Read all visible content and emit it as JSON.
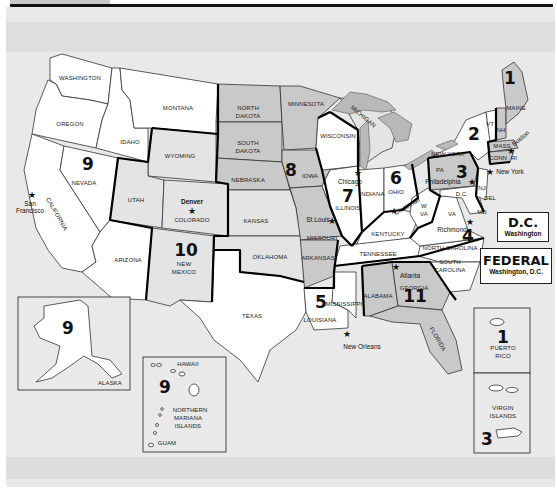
{
  "map": {
    "title": "Federal Regions of the United States",
    "colors": {
      "background": "#e9e9e9",
      "state_white": "#ffffff",
      "state_grey": "#c9c9c9",
      "state_light_grey": "#e4e4e4",
      "region_border": "#000000"
    },
    "regions": [
      {
        "number": "1",
        "states": [
          "MAINE",
          "NH",
          "VT",
          "MASS",
          "CONN",
          "RI"
        ],
        "hq_city": "Boston"
      },
      {
        "number": "2",
        "states": [
          "NEW YORK",
          "NJ",
          "PUERTO RICO",
          "VIRGIN ISLANDS"
        ],
        "hq_city": "New York"
      },
      {
        "number": "3",
        "states": [
          "PA",
          "DEL",
          "MD",
          "VA",
          "W VA",
          "D.C."
        ],
        "hq_city": "Philadelphia"
      },
      {
        "number": "4",
        "states": [
          "KENTUCKY",
          "TENNESSEE",
          "NORTH CAROLINA",
          "SOUTH CAROLINA"
        ],
        "hq_city": "Richmond"
      },
      {
        "number": "5",
        "states": [
          "LOUISIANA",
          "MISSISSIPPI"
        ],
        "hq_city": "New Orleans"
      },
      {
        "number": "6",
        "states": [
          "OHIO",
          "INDIANA",
          "MICHIGAN"
        ],
        "hq_city": "Cincinnati"
      },
      {
        "number": "7",
        "states": [
          "ILLINOIS",
          "WISCONSIN"
        ],
        "hq_city": "Chicago"
      },
      {
        "number": "8",
        "states": [
          "NORTH DAKOTA",
          "SOUTH DAKOTA",
          "NEBRASKA",
          "MINNESOTA",
          "IOWA",
          "MISSOURI",
          "ARKANSAS",
          "KANSAS",
          "OKLAHOMA"
        ],
        "hq_city": "St.Louis"
      },
      {
        "number": "9",
        "states": [
          "WASHINGTON",
          "OREGON",
          "IDAHO",
          "MONTANA",
          "CALIFORNIA",
          "NEVADA",
          "ARIZONA",
          "ALASKA",
          "HAWAII",
          "NORTHERN MARIANA ISLANDS",
          "GUAM"
        ],
        "hq_city": "San Francisco"
      },
      {
        "number": "10",
        "states": [
          "WYOMING",
          "UTAH",
          "COLORADO",
          "NEW MEXICO"
        ],
        "hq_city": "Denver"
      },
      {
        "number": "11",
        "states": [
          "ALABAMA",
          "GEORGIA",
          "FLORIDA"
        ],
        "hq_city": "Atlanta"
      }
    ],
    "state_labels": {
      "washington": "WASHINGTON",
      "oregon": "OREGON",
      "idaho": "IDAHO",
      "montana": "MONTANA",
      "wyoming": "WYOMING",
      "nevada": "NEVADA",
      "california": "CALIFORNIA",
      "utah": "UTAH",
      "colorado": "COLORADO",
      "arizona": "ARIZONA",
      "new_mexico_1": "NEW",
      "new_mexico_2": "MEXICO",
      "north_dakota_1": "NORTH",
      "north_dakota_2": "DAKOTA",
      "south_dakota_1": "SOUTH",
      "south_dakota_2": "DAKOTA",
      "nebraska": "NEBRASKA",
      "kansas": "KANSAS",
      "oklahoma": "OKLAHOMA",
      "texas": "TEXAS",
      "minnesota": "MINNESOTA",
      "iowa": "IOWA",
      "missouri": "MISSOURI",
      "arkansas": "ARKANSAS",
      "louisiana": "LOUISIANA",
      "mississippi": "MISSISSIPPI",
      "wisconsin": "WISCONSIN",
      "illinois": "ILLINOIS",
      "michigan": "MICHIGAN",
      "indiana": "INDIANA",
      "ohio": "OHIO",
      "kentucky": "KENTUCKY",
      "tennessee": "TENNESSEE",
      "alabama": "ALABAMA",
      "georgia": "GEORGIA",
      "florida": "FLORIDA",
      "south_carolina_1": "SOUTH",
      "south_carolina_2": "CAROLINA",
      "north_carolina": "NORTH CAROLINA",
      "virginia": "VA",
      "west_virginia_1": "W",
      "west_virginia_2": "VA",
      "pennsylvania": "PA",
      "new_york": "NEW YORK",
      "vermont": "VT",
      "new_hampshire": "NH",
      "maine": "MAINE",
      "massachusetts": "MASS",
      "connecticut": "CONN",
      "rhode_island": "RI",
      "new_jersey": "NJ",
      "delaware": "DEL",
      "maryland": "MD",
      "dc_small": "D.C."
    },
    "cities": {
      "san_francisco_1": "San",
      "san_francisco_2": "Francisco",
      "denver": "Denver",
      "st_louis": "St.Louis",
      "chicago": "Chicago",
      "cincinnati": "Cincinnati",
      "philadelphia": "Philadelphia",
      "new_york": "New York",
      "boston": "Boston",
      "richmond": "Richmond",
      "atlanta": "Atlanta",
      "new_orleans": "New Orleans"
    },
    "insets": {
      "alaska": {
        "label": "ALASKA",
        "region": "9"
      },
      "hawaii": {
        "label": "HAWAII",
        "region": "9",
        "marianas_1": "NORTHERN",
        "marianas_2": "MARIANA",
        "marianas_3": "ISLANDS",
        "guam": "GUAM"
      },
      "puerto_rico": {
        "label_1": "PUERTO",
        "label_2": "RICO",
        "region": "1"
      },
      "virgin_islands": {
        "label_1": "VIRGIN",
        "label_2": "ISLANDS",
        "region": "3"
      }
    },
    "legend_boxes": {
      "dc": {
        "title": "D.C.",
        "subtitle": "Washington"
      },
      "federal": {
        "title": "FEDERAL",
        "subtitle": "Washington, D.C."
      }
    },
    "star_glyph": "★"
  }
}
